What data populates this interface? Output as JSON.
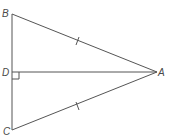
{
  "diagram": {
    "type": "geometry-triangle",
    "points": {
      "B": {
        "label": "B",
        "x": 12,
        "y": 14
      },
      "D": {
        "label": "D",
        "x": 12,
        "y": 72
      },
      "C": {
        "label": "C",
        "x": 12,
        "y": 130
      },
      "A": {
        "label": "A",
        "x": 157,
        "y": 72
      }
    },
    "segments": [
      {
        "from": "B",
        "to": "C"
      },
      {
        "from": "B",
        "to": "A"
      },
      {
        "from": "C",
        "to": "A"
      },
      {
        "from": "D",
        "to": "A"
      }
    ],
    "congruence_marks": [
      {
        "segment": "BA",
        "ticks": 1
      },
      {
        "segment": "CA",
        "ticks": 1
      }
    ],
    "right_angle_at": "D",
    "colors": {
      "line": "#555555",
      "label": "#4a4a4a",
      "background": "#ffffff"
    }
  }
}
